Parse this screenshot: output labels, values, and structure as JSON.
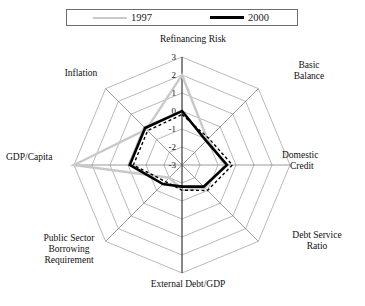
{
  "figure": {
    "title_clipped": "",
    "legend": {
      "entries": [
        {
          "label": "1997",
          "color": "#c9c9c9",
          "style": "thin-gray-line"
        },
        {
          "label": "2000",
          "color": "#000000",
          "style": "thick-black-line"
        }
      ]
    }
  },
  "chart_data": {
    "type": "radar",
    "title": "",
    "xlabel": "",
    "ylabel": "",
    "grid": true,
    "legend_position": "top",
    "rlim": [
      -3,
      3
    ],
    "rticks": [
      "3",
      "2",
      "1",
      "0",
      "-1",
      "-2",
      "-3"
    ],
    "rtick_values": [
      3,
      2,
      1,
      0,
      -1,
      -2,
      -3
    ],
    "categories": [
      "Refinancing Risk",
      "Basic Balance",
      "Domestic Credit",
      "Debt Service Ratio",
      "External Debt/GDP",
      "Public Sector Borrowing Requirement",
      "GDP/Capita",
      "Inflation"
    ],
    "series": [
      {
        "name": "1997",
        "color": "#c9c9c9",
        "values": [
          2.0,
          -1.0,
          -0.6,
          -1.2,
          -1.6,
          -2.0,
          3.0,
          -0.2
        ]
      },
      {
        "name": "2000",
        "color": "#000000",
        "values": [
          0.0,
          -1.1,
          -0.5,
          -1.3,
          -1.8,
          -1.5,
          -0.1,
          -0.1
        ]
      },
      {
        "name": "2000 dashed",
        "color": "#000000",
        "values": [
          -0.2,
          -0.9,
          -0.2,
          -1.0,
          -1.6,
          -1.7,
          -0.3,
          -0.3
        ]
      }
    ]
  },
  "axis_labels": {
    "refinancing_risk": "Refinancing Risk",
    "basic_balance_l1": "Basic",
    "basic_balance_l2": "Balance",
    "domestic_credit_l1": "Domestic",
    "domestic_credit_l2": "Credit",
    "debt_service_l1": "Debt Service",
    "debt_service_l2": "Ratio",
    "external_debt": "External Debt/GDP",
    "psbr_l1": "Public Sector",
    "psbr_l2": "Borrowing",
    "psbr_l3": "Requirement",
    "gdp_capita": "GDP/Capita",
    "inflation": "Inflation"
  },
  "ticks": {
    "t3": "3",
    "t2": "2",
    "t1": "1",
    "t0": "0",
    "tm1": "-1",
    "tm2": "-2",
    "tm3": "-3"
  }
}
